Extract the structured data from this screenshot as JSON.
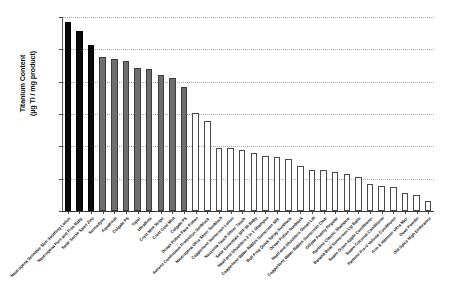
{
  "chart_data": {
    "type": "bar",
    "title": "",
    "xlabel": "",
    "ylabel": "Titanium Content\n(µg Ti / mg product)",
    "ylabel_line1": "Titanium Content",
    "ylabel_line2": "(µg Ti / mg product)",
    "scale": "log",
    "ylim": [
      0.0001,
      100
    ],
    "ytick_labels": [
      "100",
      "10",
      "1",
      "0.1",
      "0.01",
      "0.001",
      "0.0001"
    ],
    "ytick_values": [
      100,
      10,
      1,
      0.1,
      0.01,
      0.001,
      0.0001
    ],
    "grid": true,
    "grid_style": "dotted-horizontal",
    "legend": "none",
    "categories": [
      "Neutrogena Sensitive Skin Soothing Lotion",
      "Neutrogena Pure and Free Baby",
      "Solar Sense Sport Zinc",
      "Sensodyne",
      "Aquafresh",
      "Colgate PS",
      "Topol",
      "UltraBrite",
      "Crest Mint Stripe",
      "Crest Cool Mint",
      "Colgate PS",
      "Ocean Potion Face Potion",
      "Aveeno Continuous Protection Sunblock",
      "Neutrogena Ultra Sheer Sunblock",
      "Coppertone Sunscreen Lotion",
      "Noxzema Touch Sheer Touch",
      "Solar Essentials SPF 50 Baby",
      "Head and Shoulders 2 in 1 Shampoo",
      "Coppertone Water Babies Sunscreen Stik",
      "Bull Frog Quick Spray Sunblock",
      "Ocean Potion Sunblock",
      "Head and Shoulders Ocean Lift",
      "Coppertone Water Babies Sunscreen Clear",
      "Gillette Foamy Regular",
      "Pantene Classic Shampoo",
      "Banana Boat Sunscreen Lip Balm",
      "Suave Green Apple Conditioner",
      "Suave Coconut Conditioner",
      "Pantene Pro-V Volume Conditioner",
      "Arm & Hammer Ultra Max",
      "Dove Powder",
      "Old Spice High Endurance"
    ],
    "values": [
      68,
      37,
      14,
      5.6,
      4.9,
      4.5,
      2.7,
      2.5,
      1.6,
      1.3,
      0.68,
      0.105,
      0.062,
      0.0092,
      0.0086,
      0.0078,
      0.0063,
      0.0049,
      0.0047,
      0.0041,
      0.0024,
      0.0019,
      0.0019,
      0.0016,
      0.0014,
      0.0011,
      0.00068,
      0.00058,
      0.00057,
      0.00036,
      0.00032,
      0.0002
    ],
    "series_groups": [
      {
        "name": "lotion-sunscreen-black",
        "color": "#0a0a0a",
        "indices": [
          0,
          1,
          2
        ]
      },
      {
        "name": "toothpaste-gray",
        "color": "#6e6e6e",
        "indices": [
          3,
          4,
          5,
          6,
          7,
          8,
          9,
          10
        ]
      },
      {
        "name": "personal-care-white",
        "color": "#ffffff",
        "indices": [
          11,
          12,
          13,
          14,
          15,
          16,
          17,
          18,
          19,
          20,
          21,
          22,
          23,
          24,
          25,
          26,
          27,
          28,
          29,
          30,
          31
        ]
      }
    ],
    "bar_colors": [
      "black",
      "black",
      "black",
      "gray",
      "gray",
      "gray",
      "gray",
      "gray",
      "gray",
      "gray",
      "gray",
      "white",
      "white",
      "white",
      "white",
      "white",
      "white",
      "white",
      "white",
      "white",
      "white",
      "white",
      "white",
      "white",
      "white",
      "white",
      "white",
      "white",
      "white",
      "white",
      "white",
      "white"
    ]
  }
}
